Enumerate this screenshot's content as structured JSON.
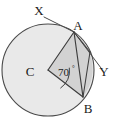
{
  "figure": {
    "type": "circle-geometry-diagram",
    "top_cropped_text": "",
    "colors": {
      "circle_fill": "#e9e9e9",
      "sector_fill": "#d2d2d2",
      "stroke": "#4a4a4a",
      "label": "#1a1a1a",
      "background": "#ffffff"
    },
    "labels": {
      "centre": "C",
      "tangent_start": "X",
      "tangent_point": "A",
      "tangent_end": "Y",
      "chord_point": "B",
      "angle_value": "70",
      "angle_degree_symbol": "°",
      "angle_text": "70°"
    },
    "geometry": {
      "circle": {
        "cx": 48,
        "cy": 70,
        "r": 46
      },
      "points": {
        "C": {
          "x": 48,
          "y": 70
        },
        "A": {
          "x": 74,
          "y": 32
        },
        "B": {
          "x": 83,
          "y": 97
        },
        "X": {
          "x": 44,
          "y": 16
        },
        "Y": {
          "x": 104,
          "y": 68
        },
        "T": {
          "x": 93,
          "y": 56
        }
      },
      "angle_arc": {
        "radius": 22,
        "start_deg": -55.6,
        "end_deg": 14.4
      },
      "central_angle_degrees": 70
    },
    "label_positions": {
      "C": {
        "x": 30,
        "y": 75
      },
      "A": {
        "x": 76,
        "y": 30
      },
      "B": {
        "x": 86,
        "y": 110
      },
      "X": {
        "x": 40,
        "y": 16
      },
      "Y": {
        "x": 99,
        "y": 77
      },
      "angle": {
        "x": 57,
        "y": 76
      }
    }
  }
}
